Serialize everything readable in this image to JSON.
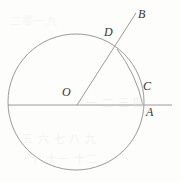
{
  "figure": {
    "kind": "geometry-diagram",
    "background_color": "#fdfdfc",
    "stroke_color": "#9a9a9a",
    "label_color": "#333333",
    "stroke_width": 1,
    "width": 180,
    "height": 182
  },
  "labels": {
    "B": "B",
    "D": "D",
    "O": "O",
    "C": "C",
    "A": "A"
  },
  "geometry": {
    "circle": {
      "cx": 76,
      "cy": 102,
      "r": 68
    },
    "horizontal_line": {
      "x1": 8,
      "y1": 105,
      "x2": 172,
      "y2": 105
    },
    "ray_OB": {
      "x1": 77,
      "y1": 105,
      "x2": 136,
      "y2": 13
    },
    "arc_DC": {
      "x1": 117,
      "y1": 49,
      "x2": 143,
      "y2": 105,
      "bulge_x": 136,
      "bulge_y": 74
    },
    "points": {
      "O": {
        "x": 77,
        "y": 105
      },
      "D": {
        "x": 117,
        "y": 49
      },
      "C": {
        "x": 143,
        "y": 105
      },
      "A": {
        "x": 168,
        "y": 105
      },
      "B": {
        "x": 136,
        "y": 13
      }
    }
  },
  "label_positions": {
    "B": {
      "left": 138,
      "top": 8
    },
    "D": {
      "left": 104,
      "top": 26
    },
    "O": {
      "left": 62,
      "top": 86
    },
    "C": {
      "left": 143,
      "top": 80
    },
    "A": {
      "left": 146,
      "top": 106
    }
  },
  "background_artifacts": [
    {
      "text": "一 二 三 四",
      "left": 86,
      "top": 94,
      "opacity": 0.5
    },
    {
      "text": "五 六 七 八 九",
      "left": 22,
      "top": 130,
      "opacity": 0.45
    },
    {
      "text": "十 十一 十二",
      "left": 30,
      "top": 150,
      "opacity": 0.4
    },
    {
      "text": "二零一九",
      "left": 10,
      "top": 12,
      "opacity": 0.3
    }
  ]
}
